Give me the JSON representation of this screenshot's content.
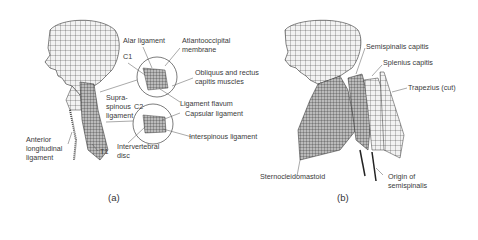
{
  "figure": {
    "panel_a": {
      "caption": "(a)",
      "labels": {
        "alar": "Alar ligament",
        "atlanto1": "Atlantooccipital",
        "atlanto2": "membrane",
        "c1": "C1",
        "obliquus1": "Obliquus and rectus",
        "obliquus2": "capitis muscles",
        "supra1": "Supra-",
        "supra2": "spinous",
        "supra3": "ligament",
        "c2": "C2",
        "flavum": "Ligament flavum",
        "capsular": "Capsular ligament",
        "anterior1": "Anterior",
        "anterior2": "longitudinal",
        "anterior3": "ligament",
        "t1": "T1",
        "interv1": "Intervertebral",
        "interv2": "disc",
        "interspinous": "Interspinous ligament"
      }
    },
    "panel_b": {
      "caption": "(b)",
      "labels": {
        "semispinalis": "Semispinalis capitis",
        "splenius": "Splenius capitis",
        "trapezius": "Trapezius (cut)",
        "sterno": "Sternocleidomastoid",
        "origin1": "Origin of",
        "origin2": "semispinalis"
      }
    }
  }
}
